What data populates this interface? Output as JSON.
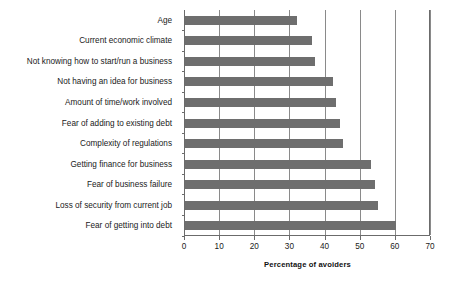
{
  "chart_data": {
    "type": "bar",
    "orientation": "horizontal",
    "title": "",
    "xlabel": "Percentage of avoiders",
    "ylabel": "",
    "xlim": [
      0,
      70
    ],
    "xticks": [
      0,
      10,
      20,
      30,
      40,
      50,
      60,
      70
    ],
    "grid": "vertical",
    "legend": "none",
    "bar_color": "#6e6e6e",
    "axis_color": "#6b6b6b",
    "gridline_color": "#8a8a8a",
    "categories": [
      "Age",
      "Current economic climate",
      "Not knowing how to start/run a business",
      "Not having an idea for business",
      "Amount of time/work involved",
      "Fear of adding to existing debt",
      "Complexity of regulations",
      "Getting finance for business",
      "Fear of business failure",
      "Loss of security from current job",
      "Fear of getting into debt"
    ],
    "values": [
      32,
      36,
      37,
      42,
      43,
      44,
      45,
      53,
      54,
      55,
      60
    ]
  }
}
